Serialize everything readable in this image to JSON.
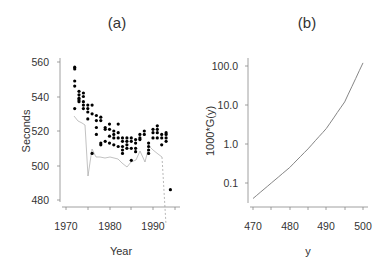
{
  "chart_data": [
    {
      "panel": "(a)",
      "type": "scatter",
      "title": "(a)",
      "xlabel": "Year",
      "ylabel": "Seconds",
      "xlim": [
        1969,
        1995
      ],
      "ylim": [
        478,
        562
      ],
      "xticks": [
        1970,
        1980,
        1990
      ],
      "yticks": [
        480,
        500,
        520,
        540,
        560
      ],
      "grid": false,
      "legend": null,
      "points": [
        [
          1972,
          557
        ],
        [
          1972,
          556
        ],
        [
          1972,
          549
        ],
        [
          1972,
          546
        ],
        [
          1972,
          533
        ],
        [
          1973,
          543
        ],
        [
          1973,
          541
        ],
        [
          1973,
          539
        ],
        [
          1973,
          538
        ],
        [
          1973,
          537
        ],
        [
          1974,
          542
        ],
        [
          1974,
          540
        ],
        [
          1974,
          537
        ],
        [
          1974,
          535
        ],
        [
          1974,
          533
        ],
        [
          1975,
          535
        ],
        [
          1975,
          533
        ],
        [
          1975,
          531
        ],
        [
          1975,
          527
        ],
        [
          1976,
          535
        ],
        [
          1976,
          530
        ],
        [
          1976,
          507
        ],
        [
          1977,
          529
        ],
        [
          1977,
          526
        ],
        [
          1977,
          522
        ],
        [
          1977,
          518
        ],
        [
          1978,
          528
        ],
        [
          1978,
          526
        ],
        [
          1978,
          513
        ],
        [
          1978,
          512
        ],
        [
          1979,
          522
        ],
        [
          1979,
          521
        ],
        [
          1979,
          514
        ],
        [
          1980,
          524
        ],
        [
          1980,
          521
        ],
        [
          1980,
          517
        ],
        [
          1980,
          513
        ],
        [
          1981,
          520
        ],
        [
          1981,
          518
        ],
        [
          1981,
          516
        ],
        [
          1981,
          512
        ],
        [
          1982,
          524
        ],
        [
          1982,
          519
        ],
        [
          1982,
          516
        ],
        [
          1982,
          511
        ],
        [
          1983,
          516
        ],
        [
          1983,
          514
        ],
        [
          1983,
          511
        ],
        [
          1983,
          509
        ],
        [
          1983,
          507
        ],
        [
          1984,
          516
        ],
        [
          1984,
          514
        ],
        [
          1984,
          512
        ],
        [
          1984,
          510
        ],
        [
          1985,
          516
        ],
        [
          1985,
          514
        ],
        [
          1985,
          510
        ],
        [
          1985,
          503
        ],
        [
          1986,
          515
        ],
        [
          1986,
          513
        ],
        [
          1986,
          510
        ],
        [
          1986,
          508
        ],
        [
          1987,
          518
        ],
        [
          1987,
          516
        ],
        [
          1987,
          515
        ],
        [
          1988,
          520
        ],
        [
          1988,
          518
        ],
        [
          1989,
          513
        ],
        [
          1989,
          511
        ],
        [
          1989,
          509
        ],
        [
          1989,
          507
        ],
        [
          1990,
          521
        ],
        [
          1990,
          519
        ],
        [
          1990,
          516
        ],
        [
          1991,
          523
        ],
        [
          1991,
          521
        ],
        [
          1991,
          519
        ],
        [
          1991,
          516
        ],
        [
          1992,
          518
        ],
        [
          1992,
          516
        ],
        [
          1992,
          512
        ],
        [
          1993,
          519
        ],
        [
          1993,
          518
        ],
        [
          1993,
          516
        ],
        [
          1993,
          514
        ],
        [
          1994,
          486
        ]
      ],
      "connector_line": "thin grey line through yearly minima, dashed from 1993 to 1994 point at ~486"
    },
    {
      "panel": "(b)",
      "type": "line",
      "title": "(b)",
      "xlabel": "y",
      "ylabel": "1000*G(y)",
      "yscale": "log",
      "xlim": [
        469,
        501
      ],
      "ylim": [
        0.025,
        150
      ],
      "xticks": [
        470,
        480,
        490,
        500
      ],
      "yticks": [
        "0.1",
        "1.0",
        "10.0",
        "100.0"
      ],
      "grid": false,
      "legend": null,
      "x": [
        470,
        475,
        480,
        485,
        490,
        495,
        500
      ],
      "values": [
        0.04,
        0.1,
        0.25,
        0.75,
        2.5,
        12,
        120
      ]
    }
  ],
  "panels": {
    "a": {
      "title": "(a)",
      "xlabel": "Year",
      "ylabel": "Seconds",
      "xtick_labels": [
        "1970",
        "1980",
        "1990"
      ],
      "ytick_labels": [
        "480",
        "500",
        "520",
        "540",
        "560"
      ]
    },
    "b": {
      "title": "(b)",
      "xlabel": "y",
      "ylabel": "1000*G(y)",
      "xtick_labels": [
        "470",
        "480",
        "490",
        "500"
      ],
      "ytick_labels": [
        "0.1",
        "1.0",
        "10.0",
        "100.0"
      ]
    }
  },
  "colors": {
    "axis": "#888888",
    "points": "#000000",
    "curve": "#777777",
    "text": "#333333"
  }
}
